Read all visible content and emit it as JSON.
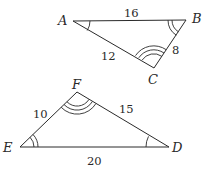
{
  "triangles": [
    {
      "name": "ABC",
      "vertices": {
        "A": {
          "label": "A",
          "angle_marks": 1
        },
        "B": {
          "label": "B",
          "angle_marks": 2
        },
        "C": {
          "label": "C",
          "angle_marks": 3
        }
      },
      "sides": {
        "AB": "16",
        "AC": "12",
        "BC": "8"
      }
    },
    {
      "name": "DEF",
      "vertices": {
        "D": {
          "label": "D",
          "angle_marks": 1
        },
        "E": {
          "label": "E",
          "angle_marks": 2
        },
        "F": {
          "label": "F",
          "angle_marks": 3
        }
      },
      "sides": {
        "ED": "20",
        "EF": "10",
        "FD": "15"
      }
    }
  ],
  "colors": {
    "stroke": "#2a2a2a",
    "background": "#ffffff"
  }
}
